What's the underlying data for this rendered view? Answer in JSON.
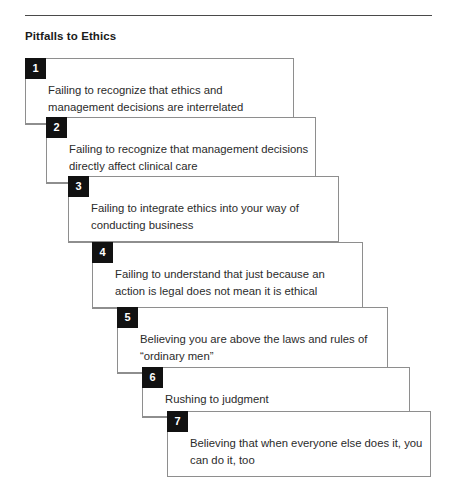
{
  "figure": {
    "title": "Pitfalls to Ethics",
    "rule_color": "#4a4a4a",
    "badge_color": "#111111",
    "badge_text_color": "#ffffff",
    "border_color": "#8e8e8e",
    "text_color": "#2b2b2b",
    "background": "#ffffff"
  },
  "steps": [
    {
      "number": "1",
      "text": "Failing to recognize that ethics and management decisions are interrelated",
      "left": 25,
      "top": 58,
      "width": 269,
      "height": 66
    },
    {
      "number": "2",
      "text": "Failing to recognize that management decisions directly affect clinical care",
      "left": 46,
      "top": 117,
      "width": 270,
      "height": 66
    },
    {
      "number": "3",
      "text": "Failing to integrate ethics into your way of conducting business",
      "left": 68,
      "top": 176,
      "width": 271,
      "height": 66
    },
    {
      "number": "4",
      "text": "Failing to understand that just because an action is legal does not mean it is ethical",
      "left": 92,
      "top": 242,
      "width": 271,
      "height": 66
    },
    {
      "number": "5",
      "text": "Believing you are above the laws and rules of “ordinary men”",
      "left": 117,
      "top": 307,
      "width": 271,
      "height": 66
    },
    {
      "number": "6",
      "text": "Rushing to judgment",
      "left": 142,
      "top": 367,
      "width": 268,
      "height": 50
    },
    {
      "number": "7",
      "text": "Believing that when everyone else does it, you can do it, too",
      "left": 167,
      "top": 411,
      "width": 264,
      "height": 66
    }
  ]
}
